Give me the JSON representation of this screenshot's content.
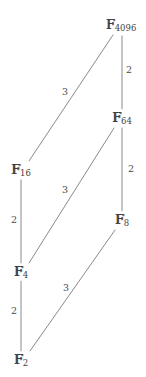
{
  "diagram": {
    "type": "hasse-diagram",
    "line_color": "#8a8a8a",
    "text_color": "#3f3f3f",
    "background": "#ffffff",
    "nodes": [
      {
        "id": "F4096",
        "field": "F",
        "subscript": "4096",
        "x": 121,
        "y": 25
      },
      {
        "id": "F64",
        "field": "F",
        "subscript": "64",
        "x": 122,
        "y": 118
      },
      {
        "id": "F16",
        "field": "F",
        "subscript": "16",
        "x": 21,
        "y": 170
      },
      {
        "id": "F8",
        "field": "F",
        "subscript": "8",
        "x": 122,
        "y": 220
      },
      {
        "id": "F4",
        "field": "F",
        "subscript": "4",
        "x": 21,
        "y": 272
      },
      {
        "id": "F2",
        "field": "F",
        "subscript": "2",
        "x": 21,
        "y": 360
      }
    ],
    "edges": [
      {
        "id": "e-F16-F4096",
        "from": "F16",
        "to": "F4096",
        "degree": "3",
        "x1": 29,
        "y1": 161,
        "x2": 113,
        "y2": 35,
        "lx": 65,
        "ly": 92
      },
      {
        "id": "e-F64-F4096",
        "from": "F64",
        "to": "F4096",
        "degree": "2",
        "x1": 122,
        "y1": 109,
        "x2": 122,
        "y2": 36,
        "lx": 129,
        "ly": 70
      },
      {
        "id": "e-F4-F64",
        "from": "F4",
        "to": "F64",
        "degree": "3",
        "x1": 29,
        "y1": 263,
        "x2": 114,
        "y2": 128,
        "lx": 65,
        "ly": 190
      },
      {
        "id": "e-F8-F64",
        "from": "F8",
        "to": "F64",
        "degree": "2",
        "x1": 122,
        "y1": 211,
        "x2": 122,
        "y2": 128,
        "lx": 131,
        "ly": 169
      },
      {
        "id": "e-F4-F16",
        "from": "F4",
        "to": "F16",
        "degree": "2",
        "x1": 21,
        "y1": 263,
        "x2": 21,
        "y2": 180,
        "lx": 14,
        "ly": 220
      },
      {
        "id": "e-F2-F4",
        "from": "F2",
        "to": "F4",
        "degree": "2",
        "x1": 21,
        "y1": 351,
        "x2": 21,
        "y2": 281,
        "lx": 14,
        "ly": 311
      },
      {
        "id": "e-F2-F8",
        "from": "F2",
        "to": "F8",
        "degree": "3",
        "x1": 30,
        "y1": 351,
        "x2": 115,
        "y2": 230,
        "lx": 66,
        "ly": 288
      }
    ]
  }
}
